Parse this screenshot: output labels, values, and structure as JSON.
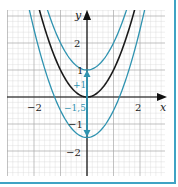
{
  "axes": {
    "x_label": "x",
    "y_label": "y",
    "x_ticks": [
      {
        "value": -2,
        "label": "−2"
      },
      {
        "value": 2,
        "label": "2"
      }
    ],
    "y_ticks": [
      {
        "value": 2,
        "label": "2"
      },
      {
        "value": 1,
        "label": "1"
      },
      {
        "value": -1,
        "label": "−1"
      },
      {
        "value": -2,
        "label": "−2"
      }
    ]
  },
  "annotations": {
    "shift_up_label": "+1",
    "shift_down_label": "−1,5"
  },
  "colors": {
    "accent": "#2f93b0",
    "base_curve": "#1a1a1a",
    "grid_minor": "#d6d6d6",
    "grid_major": "#a8a8a8",
    "border": "#3fa3c4"
  },
  "chart_data": {
    "type": "line",
    "title": "",
    "xlabel": "x",
    "ylabel": "y",
    "xlim": [
      -3.1,
      3.0
    ],
    "ylim": [
      -2.8,
      3.2
    ],
    "grid": true,
    "series": [
      {
        "name": "y = x²",
        "color": "#1a1a1a",
        "vertex": [
          0,
          0
        ],
        "shift": 0
      },
      {
        "name": "y = x² + 1",
        "color": "#2f93b0",
        "vertex": [
          0,
          1
        ],
        "shift": 1
      },
      {
        "name": "y = x² − 1,5",
        "color": "#2f93b0",
        "vertex": [
          0,
          -1.5
        ],
        "shift": -1.5
      }
    ],
    "annotations": [
      {
        "text": "+1",
        "type": "arrow",
        "from": [
          0,
          0
        ],
        "to": [
          0,
          1
        ]
      },
      {
        "text": "−1,5",
        "type": "arrow",
        "from": [
          0,
          0
        ],
        "to": [
          0,
          -1.5
        ]
      }
    ]
  }
}
